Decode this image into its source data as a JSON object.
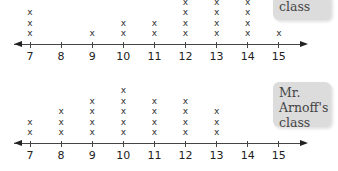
{
  "chart_data": [
    {
      "type": "dot_plot",
      "title": "",
      "label_box": "class",
      "categories": [
        7,
        8,
        9,
        10,
        11,
        12,
        13,
        14,
        15
      ],
      "values": [
        3,
        0,
        1,
        2,
        2,
        4,
        4,
        4,
        1
      ],
      "note": "top plot partially cropped at top edge; columns 12-14 show at least 4 marks",
      "xlabel": "",
      "ylabel": "",
      "axis_range": [
        7,
        15
      ],
      "marker": "x"
    },
    {
      "type": "dot_plot",
      "title": "",
      "label_box": "Mr. Arnoff's class",
      "categories": [
        7,
        8,
        9,
        10,
        11,
        12,
        13,
        14,
        15
      ],
      "values": [
        2,
        3,
        4,
        5,
        4,
        4,
        3,
        0,
        0
      ],
      "xlabel": "",
      "ylabel": "",
      "axis_range": [
        7,
        15
      ],
      "marker": "x"
    }
  ],
  "top_plot": {
    "box_text": "class",
    "tick_labels": [
      "7",
      "8",
      "9",
      "10",
      "11",
      "12",
      "13",
      "14",
      "15"
    ]
  },
  "bottom_plot": {
    "box_lines": [
      "Mr.",
      "Arnoff's",
      "class"
    ],
    "tick_labels": [
      "7",
      "8",
      "9",
      "10",
      "11",
      "12",
      "13",
      "14",
      "15"
    ]
  },
  "mark_glyph": "x"
}
